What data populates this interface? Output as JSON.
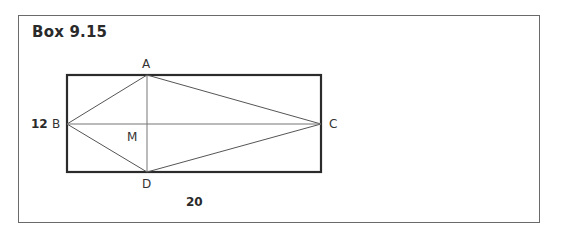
{
  "box": {
    "title": "Box 9.15"
  },
  "figure": {
    "rectangle": {
      "width_label": "20",
      "height_label": "12"
    },
    "points": {
      "A": "A",
      "B": "B",
      "C": "C",
      "D": "D",
      "M": "M"
    },
    "segments": [
      "AB",
      "AC",
      "BD",
      "DC",
      "AD",
      "BC"
    ],
    "colors": {
      "rectangle_stroke": "#2b2b2b",
      "line_stroke": "#555555",
      "frame_stroke": "#6a6a6a"
    }
  }
}
